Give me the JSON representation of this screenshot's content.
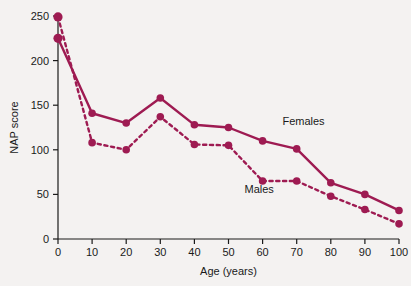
{
  "chart_data": {
    "type": "line",
    "title": "",
    "xlabel": "Age (years)",
    "ylabel": "NAP score",
    "xlim": [
      0,
      100
    ],
    "ylim": [
      0,
      250
    ],
    "xticks": [
      0,
      10,
      20,
      30,
      40,
      50,
      60,
      70,
      80,
      90,
      100
    ],
    "yticks": [
      0,
      50,
      100,
      150,
      200,
      250
    ],
    "grid": false,
    "legend_position": "inline-annotation",
    "x": [
      0,
      10,
      20,
      30,
      40,
      50,
      60,
      70,
      80,
      90,
      100
    ],
    "series": [
      {
        "name": "Females",
        "style": "solid",
        "color": "#9e1b52",
        "values": [
          225,
          141,
          130,
          158,
          128,
          125,
          110,
          101,
          63,
          50,
          32
        ]
      },
      {
        "name": "Males",
        "style": "dotted",
        "color": "#9e1b52",
        "values": [
          249,
          108,
          100,
          137,
          106,
          105,
          65,
          65,
          48,
          33,
          17
        ]
      }
    ],
    "annotations": [
      {
        "text": "Females",
        "x": 72,
        "y": 128
      },
      {
        "text": "Males",
        "x": 59,
        "y": 52
      }
    ]
  },
  "axes": {
    "x_tick_labels": [
      "0",
      "10",
      "20",
      "30",
      "40",
      "50",
      "60",
      "70",
      "80",
      "90",
      "100"
    ],
    "y_tick_labels": [
      "0",
      "50",
      "100",
      "150",
      "200",
      "250"
    ],
    "x_axis_title": "Age (years)",
    "y_axis_title": "NAP score"
  },
  "colors": {
    "series": "#9e1b52",
    "axis": "#1a1a1a",
    "background": "#f4f2f1"
  }
}
